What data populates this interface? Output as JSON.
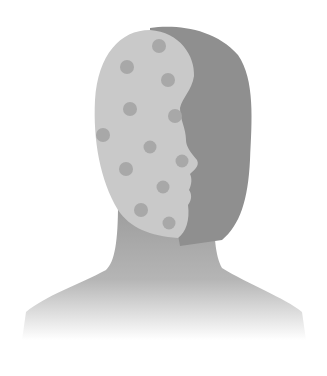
{
  "image": {
    "subject": "head-and-shoulders silhouette with spotted face mask",
    "width": 327,
    "height": 376
  },
  "colors": {
    "background": "#ffffff",
    "head_dark": "#8f8f8f",
    "neck": "#9a9a9a",
    "face_light": "#c9c9c9",
    "dots": "#a8a8a8"
  },
  "dots": [
    {
      "cx": 159,
      "cy": 46,
      "r": 7
    },
    {
      "cx": 127,
      "cy": 67,
      "r": 7
    },
    {
      "cx": 168,
      "cy": 80,
      "r": 7
    },
    {
      "cx": 130,
      "cy": 109,
      "r": 7
    },
    {
      "cx": 175,
      "cy": 116,
      "r": 7
    },
    {
      "cx": 103,
      "cy": 135,
      "r": 7
    },
    {
      "cx": 150,
      "cy": 147,
      "r": 6.5
    },
    {
      "cx": 182,
      "cy": 161,
      "r": 6.5
    },
    {
      "cx": 126,
      "cy": 169,
      "r": 7
    },
    {
      "cx": 163,
      "cy": 187,
      "r": 6.5
    },
    {
      "cx": 141,
      "cy": 210,
      "r": 7
    },
    {
      "cx": 169,
      "cy": 223,
      "r": 6.5
    }
  ]
}
